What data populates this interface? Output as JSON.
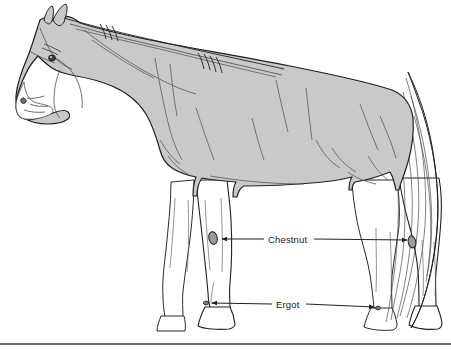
{
  "figure": {
    "kind": "anatomical-line-drawing",
    "view": "left lateral / side view, facing left",
    "colors": {
      "background": "#ffffff",
      "body_fill": "#c9c9c9",
      "leg_fill": "#ffffff",
      "outline": "#231f20",
      "detail_line": "#4d4a4b",
      "label_text": "#1a1a1a",
      "leader_line": "#231f20",
      "divider": "#6b6b6b"
    },
    "parts": {
      "body": "horse-body",
      "head": "horse-head",
      "mane": "horse-mane",
      "tail": "horse-tail",
      "eye": "horse-eye",
      "nostril": "horse-nostril",
      "ear_near": "horse-ear-near",
      "ear_far": "horse-ear-far",
      "foreleg_near": "horse-foreleg-near",
      "foreleg_far": "horse-foreleg-far",
      "hindleg_near": "horse-hindleg-near",
      "hindleg_far": "horse-hindleg-far",
      "hooves": "horse-hooves"
    }
  },
  "callouts": [
    {
      "id": "chestnut",
      "label": "Chestnut",
      "label_x": 268,
      "label_y": 234,
      "left_line": {
        "x1": 264,
        "y1": 239,
        "x2": 222,
        "y2": 239
      },
      "left_arrow_tip": {
        "x": 218,
        "y": 239
      },
      "right_line": {
        "x1": 314,
        "y1": 239,
        "x2": 406,
        "y2": 239
      },
      "right_arrow_tip": {
        "x": 410,
        "y": 240
      },
      "target_near": "front leg chestnut (inside of foreleg above knee)",
      "target_far": "hind leg chestnut (inside of hock)"
    },
    {
      "id": "ergot",
      "label": "Ergot",
      "label_x": 276,
      "label_y": 299,
      "left_line": {
        "x1": 272,
        "y1": 304,
        "x2": 213,
        "y2": 304
      },
      "left_arrow_tip": {
        "x": 208,
        "y": 303
      },
      "right_line": {
        "x1": 306,
        "y1": 304,
        "x2": 375,
        "y2": 307
      },
      "right_arrow_tip": {
        "x": 380,
        "y": 308
      },
      "target_near": "front leg ergot (back of fetlock)",
      "target_far": "hind leg ergot (back of fetlock)"
    }
  ],
  "divider": {
    "name": "bottom-divider-rule",
    "y": 344,
    "x1": 0,
    "x2": 451,
    "thickness": 2
  }
}
